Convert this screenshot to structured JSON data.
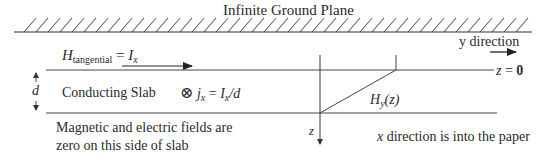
{
  "diagram": {
    "ground_plane_label": "Infinite Ground Plane",
    "h_tangential": {
      "symbol": "H",
      "subscript": "tangential",
      "equals": " = ",
      "value_symbol": "I",
      "value_subscript": "x"
    },
    "y_direction_label": "y direction",
    "z_zero_label": {
      "var": "z",
      "eq": " = ",
      "val": "0"
    },
    "d_label": "d",
    "slab_label": "Conducting Slab",
    "current_density": {
      "symbol": "⊗",
      "j": "j",
      "j_sub": "x",
      "eq": " = ",
      "rhs_I": "I",
      "rhs_sub": "x",
      "rhs_div": "/d"
    },
    "hy_label": {
      "H": "H",
      "sub": "y",
      "arg": "(z)"
    },
    "z_axis_label": "z",
    "fields_zero_note_line1": "Magnetic and electric fields are",
    "fields_zero_note_line2": "zero on this side of slab",
    "x_direction_note": {
      "var": "x",
      "text": " direction is into the paper"
    },
    "colors": {
      "line": "#3a3a3a",
      "text": "#2a2a2a",
      "background": "#ffffff"
    }
  }
}
